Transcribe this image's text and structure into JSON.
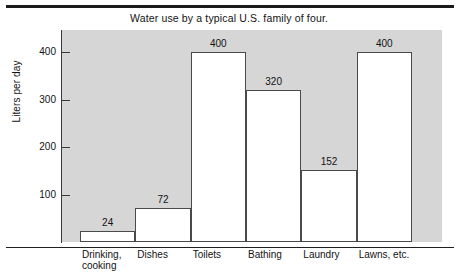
{
  "figure": {
    "title": "Water use by a typical U.S. family of four.",
    "ylabel": "Liters per day"
  },
  "chart_data": {
    "type": "bar",
    "title": "Water use by a typical U.S. family of four.",
    "xlabel": "",
    "ylabel": "Liters per day",
    "categories": [
      "Drinking,\ncooking",
      "Dishes",
      "Toilets",
      "Bathing",
      "Laundry",
      "Lawns, etc."
    ],
    "values": [
      24,
      72,
      400,
      320,
      152,
      400
    ],
    "value_labels": [
      "24",
      "72",
      "400",
      "320",
      "152",
      "400"
    ],
    "ylim": [
      0,
      425
    ],
    "yticks": [
      100,
      200,
      300,
      400
    ],
    "ytick_labels": [
      "100",
      "200",
      "300",
      "400"
    ],
    "grid": false,
    "legend": false,
    "colors": {
      "plot_background": "#d6d6d6",
      "bar_fill": "#ffffff",
      "bar_edge": "#4a4a4a",
      "axis": "#3a3a3a",
      "text": "#131313",
      "frame": "#1b1b1b"
    }
  }
}
